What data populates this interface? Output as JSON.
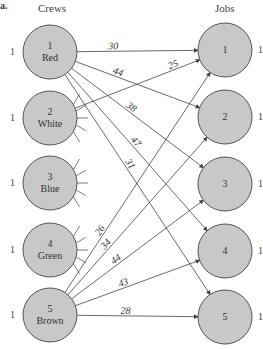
{
  "figure_tag": "a.",
  "headers": {
    "left": "Crews",
    "right": "Jobs"
  },
  "crews": [
    {
      "id": "1",
      "name": "Red",
      "supply": "1",
      "x": 50,
      "y": 52
    },
    {
      "id": "2",
      "name": "White",
      "supply": "1",
      "x": 50,
      "y": 118
    },
    {
      "id": "3",
      "name": "Blue",
      "supply": "1",
      "x": 50,
      "y": 183
    },
    {
      "id": "4",
      "name": "Green",
      "supply": "1",
      "x": 50,
      "y": 250
    },
    {
      "id": "5",
      "name": "Brown",
      "supply": "1",
      "x": 50,
      "y": 315
    }
  ],
  "jobs": [
    {
      "id": "1",
      "demand": "1",
      "x": 225,
      "y": 50
    },
    {
      "id": "2",
      "demand": "1",
      "x": 225,
      "y": 117
    },
    {
      "id": "3",
      "demand": "1",
      "x": 225,
      "y": 184
    },
    {
      "id": "4",
      "demand": "1",
      "x": 225,
      "y": 251
    },
    {
      "id": "5",
      "demand": "1",
      "x": 225,
      "y": 317
    }
  ],
  "edges": [
    {
      "from": "1",
      "to": "1",
      "cost": "30"
    },
    {
      "from": "1",
      "to": "2",
      "cost": "44"
    },
    {
      "from": "1",
      "to": "3",
      "cost": "38"
    },
    {
      "from": "1",
      "to": "4",
      "cost": "47"
    },
    {
      "from": "1",
      "to": "5",
      "cost": "31"
    },
    {
      "from": "2",
      "to": "1",
      "cost": "25"
    },
    {
      "from": "5",
      "to": "1",
      "cost": "26"
    },
    {
      "from": "5",
      "to": "2",
      "cost": "34"
    },
    {
      "from": "5",
      "to": "3",
      "cost": "44"
    },
    {
      "from": "5",
      "to": "4",
      "cost": "43"
    },
    {
      "from": "5",
      "to": "5",
      "cost": "28"
    }
  ],
  "colors": {
    "node_fill": "#c8c8c8",
    "node_stroke": "#555555",
    "edge": "#444444"
  }
}
